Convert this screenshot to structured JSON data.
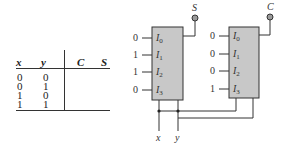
{
  "truth_table": {
    "headers": [
      "x",
      "y",
      "C",
      "S"
    ],
    "rows": [
      [
        "0",
        "0",
        "",
        ""
      ],
      [
        "0",
        "1",
        "",
        ""
      ],
      [
        "1",
        "0",
        "",
        ""
      ],
      [
        "1",
        "1",
        "",
        ""
      ]
    ]
  },
  "mux_s": {
    "output_label": "S",
    "inputs": [
      {
        "label": "I",
        "sub": "0",
        "value": "0"
      },
      {
        "label": "I",
        "sub": "1",
        "value": "1"
      },
      {
        "label": "I",
        "sub": "2",
        "value": "1"
      },
      {
        "label": "I",
        "sub": "3",
        "value": "0"
      }
    ]
  },
  "mux_c": {
    "output_label": "C",
    "inputs": [
      {
        "label": "I",
        "sub": "0",
        "value": "0"
      },
      {
        "label": "I",
        "sub": "1",
        "value": "0"
      },
      {
        "label": "I",
        "sub": "2",
        "value": "0"
      },
      {
        "label": "I",
        "sub": "3",
        "value": "1"
      }
    ]
  },
  "select_lines": {
    "x": "x",
    "y": "y"
  },
  "colors": {
    "mux_fill": "#c8c8c8",
    "line": "#333333",
    "terminal": "#9a9a9a"
  }
}
